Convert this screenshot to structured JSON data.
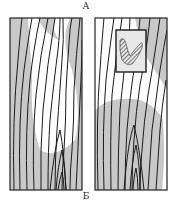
{
  "figure": {
    "label_top": "А",
    "label_bottom": "Б",
    "colors": {
      "shade": "#c8c8c8",
      "line": "#1a1a1a",
      "background": "#ffffff",
      "frame": "#222222"
    },
    "panels": [
      {
        "id": "left",
        "description": "ridge-line pattern with shaded regions"
      },
      {
        "id": "right",
        "description": "ridge-line pattern with shaded region and inset box containing hatched blob"
      }
    ]
  }
}
